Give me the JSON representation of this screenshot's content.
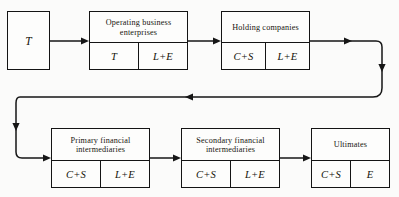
{
  "diagram": {
    "background_color": "#fbfbfa",
    "line_color": "#161616",
    "box_border_color": "#141414",
    "nodes": [
      {
        "id": "source",
        "label": "",
        "value": "T",
        "cells": [
          "T"
        ]
      },
      {
        "id": "operating-business-enterprises",
        "label": "Operating business enterprises",
        "cells": [
          "T",
          "L+E"
        ]
      },
      {
        "id": "holding-companies",
        "label": "Holding companies",
        "cells": [
          "C+S",
          "L+E"
        ]
      },
      {
        "id": "primary-financial-intermediaries",
        "label": "Primary financial intermediaries",
        "cells": [
          "C+S",
          "L+E"
        ]
      },
      {
        "id": "secondary-financial-intermediaries",
        "label": "Secondary financial intermediaries",
        "cells": [
          "C+S",
          "L+E"
        ]
      },
      {
        "id": "ultimates",
        "label": "Ultimates",
        "cells": [
          "C+S",
          "E"
        ]
      }
    ]
  }
}
